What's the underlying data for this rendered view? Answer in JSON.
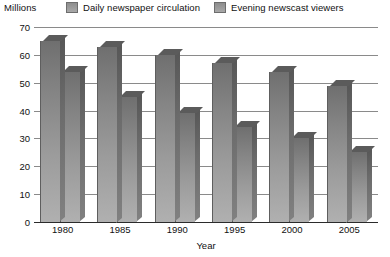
{
  "chart_data": {
    "type": "bar",
    "title": "",
    "subtitle": "",
    "unit_label": "Millions",
    "xlabel": "Year",
    "ylabel": "Millions",
    "categories": [
      "1980",
      "1985",
      "1990",
      "1995",
      "2000",
      "2005"
    ],
    "series": [
      {
        "name": "Daily newspaper circulation",
        "values": [
          65,
          63,
          60,
          57,
          54,
          49
        ],
        "color": "#8d8d8d"
      },
      {
        "name": "Evening newscast viewers",
        "values": [
          54,
          45,
          39,
          34,
          30,
          25
        ],
        "color": "#8d8d8d"
      }
    ],
    "ylim": [
      0,
      70
    ],
    "yticks": [
      0,
      10,
      20,
      30,
      40,
      50,
      60,
      70
    ],
    "ytick_labels": [
      "0",
      "10",
      "20",
      "30",
      "40",
      "50",
      "60",
      "70"
    ],
    "grid": true,
    "legend_position": "top",
    "style": "3d-bars-grayscale"
  },
  "legend": {
    "entries": [
      {
        "label": "Daily newspaper circulation",
        "swatch": "series-0"
      },
      {
        "label": "Evening newscast viewers",
        "swatch": "series-1"
      }
    ]
  },
  "colors": {
    "bar_top": "#6f6f6f",
    "bar_bottom": "#b0b0b0",
    "bar_side": "#6b6b6b",
    "gridline": "#8a8a8a",
    "axis": "#2b2b2b",
    "text": "#111111",
    "background": "#ffffff"
  }
}
